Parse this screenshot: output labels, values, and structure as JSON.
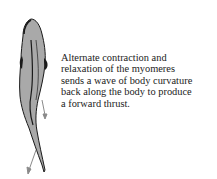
{
  "figure": {
    "caption_lines": [
      "Alternate contraction and",
      "relaxation of the myomeres",
      "sends a wave of body curvature",
      "back along the body to produce",
      "a forward thrust."
    ],
    "colors": {
      "body_fill": "#a9a9a9",
      "outline": "#1a1a1a",
      "arrow": "#8a8a8a",
      "text": "#222222",
      "background": "#ffffff"
    }
  }
}
